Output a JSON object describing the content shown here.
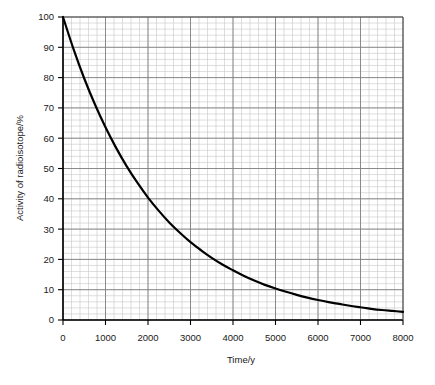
{
  "chart_data": {
    "type": "line",
    "title": "",
    "subtitle": "",
    "xlabel": "Time/y",
    "ylabel": "Activity of radioisotope/%",
    "xlim": [
      0,
      8000
    ],
    "ylim": [
      0,
      100
    ],
    "xticks": [
      0,
      1000,
      2000,
      3000,
      4000,
      5000,
      6000,
      7000,
      8000
    ],
    "xtick_labels": [
      "0",
      "1000",
      "2000",
      "3000",
      "4000",
      "5000",
      "6000",
      "7000",
      "8000"
    ],
    "yticks": [
      0,
      10,
      20,
      30,
      40,
      50,
      60,
      70,
      80,
      90,
      100
    ],
    "ytick_labels": [
      "0",
      "10",
      "20",
      "30",
      "40",
      "50",
      "60",
      "70",
      "80",
      "90",
      "100"
    ],
    "grid": true,
    "grid_major_color": "#808080",
    "grid_minor_color": "#c8c8c8",
    "minor_divisions_per_major_x": 5,
    "minor_divisions_per_major_y": 5,
    "legend": null,
    "legend_position": "none",
    "curve_color": "#000000",
    "curve_width": 2.2,
    "half_life_y": 1530,
    "series": [
      {
        "name": "Activity of radioisotope",
        "x": [
          0,
          250,
          500,
          750,
          1000,
          1250,
          1500,
          1750,
          2000,
          2250,
          2500,
          2750,
          3000,
          3250,
          3500,
          3750,
          4000,
          4250,
          4500,
          4750,
          5000,
          5250,
          5500,
          5750,
          6000,
          6250,
          6500,
          6750,
          7000,
          7250,
          7500,
          7750,
          8000
        ],
        "y": [
          100.0,
          89.3,
          79.7,
          71.2,
          63.6,
          56.8,
          50.7,
          45.3,
          40.4,
          36.1,
          32.2,
          28.8,
          25.7,
          23.0,
          20.5,
          18.3,
          16.4,
          14.6,
          13.0,
          11.6,
          10.4,
          9.3,
          8.3,
          7.4,
          6.6,
          5.9,
          5.3,
          4.7,
          4.2,
          3.7,
          3.3,
          3.0,
          2.7
        ]
      }
    ]
  },
  "axes": {
    "x_axis_title": "Time/y",
    "y_axis_title": "Activity of radioisotope/%"
  }
}
